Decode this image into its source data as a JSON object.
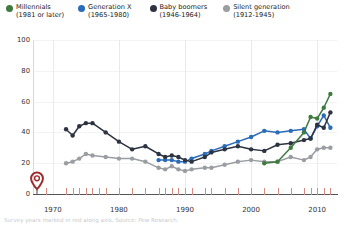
{
  "legend": {
    "position": "top",
    "items": [
      {
        "label": "Millennials",
        "sub": "(1981 or later)",
        "color": "#3f7a3f",
        "icon": "legend-dot-icon"
      },
      {
        "label": "Generation X",
        "sub": "(1965-1980)",
        "color": "#2b6cb8",
        "icon": "legend-dot-icon"
      },
      {
        "label": "Baby boomers",
        "sub": "(1946-1964)",
        "color": "#2d3340",
        "icon": "legend-dot-icon"
      },
      {
        "label": "Silent generation",
        "sub": "(1912-1945)",
        "color": "#9a9da1",
        "icon": "legend-dot-icon"
      }
    ]
  },
  "axes": {
    "y_ticks": [
      "0",
      "20",
      "40",
      "60",
      "80",
      "100"
    ],
    "x_ticks": [
      "1970",
      "1980",
      "1990",
      "2000",
      "2010"
    ]
  },
  "marker": {
    "name": "origin-pin-marker",
    "color": "#9e2b2b",
    "year": 1969,
    "value": 0
  },
  "caption": {
    "text": "Survey years marked in red along axis. Source: Pew Research."
  },
  "chart_data": {
    "type": "line",
    "title": "",
    "xlabel": "",
    "ylabel": "",
    "xlim": [
      1967,
      2013
    ],
    "ylim": [
      0,
      100
    ],
    "grid": "vertical-decades",
    "legend_position": "top",
    "survey_years": [
      1969,
      1972,
      1973,
      1974,
      1975,
      1976,
      1977,
      1978,
      1980,
      1982,
      1984,
      1986,
      1987,
      1988,
      1989,
      1990,
      1991,
      1993,
      1994,
      1996,
      1998,
      2000,
      2002,
      2004,
      2006,
      2008,
      2009,
      2010,
      2011,
      2012
    ],
    "series": [
      {
        "name": "Millennials",
        "color": "#3f7a3f",
        "points": [
          {
            "x": 2002,
            "y": 20
          },
          {
            "x": 2004,
            "y": 21
          },
          {
            "x": 2006,
            "y": 30
          },
          {
            "x": 2008,
            "y": 40
          },
          {
            "x": 2009,
            "y": 50
          },
          {
            "x": 2010,
            "y": 49
          },
          {
            "x": 2011,
            "y": 56
          },
          {
            "x": 2012,
            "y": 65
          }
        ]
      },
      {
        "name": "Generation X",
        "color": "#2b6cb8",
        "points": [
          {
            "x": 1986,
            "y": 22
          },
          {
            "x": 1987,
            "y": 22
          },
          {
            "x": 1988,
            "y": 22
          },
          {
            "x": 1989,
            "y": 21
          },
          {
            "x": 1990,
            "y": 21
          },
          {
            "x": 1991,
            "y": 23
          },
          {
            "x": 1993,
            "y": 26
          },
          {
            "x": 1994,
            "y": 28
          },
          {
            "x": 1996,
            "y": 31
          },
          {
            "x": 1998,
            "y": 34
          },
          {
            "x": 2000,
            "y": 37
          },
          {
            "x": 2002,
            "y": 41
          },
          {
            "x": 2004,
            "y": 40
          },
          {
            "x": 2006,
            "y": 41
          },
          {
            "x": 2008,
            "y": 42
          },
          {
            "x": 2009,
            "y": 36
          },
          {
            "x": 2010,
            "y": 44
          },
          {
            "x": 2011,
            "y": 51
          },
          {
            "x": 2012,
            "y": 43
          }
        ]
      },
      {
        "name": "Baby boomers",
        "color": "#2d3340",
        "points": [
          {
            "x": 1972,
            "y": 42
          },
          {
            "x": 1973,
            "y": 38
          },
          {
            "x": 1974,
            "y": 44
          },
          {
            "x": 1975,
            "y": 46
          },
          {
            "x": 1976,
            "y": 46
          },
          {
            "x": 1978,
            "y": 40
          },
          {
            "x": 1980,
            "y": 34
          },
          {
            "x": 1982,
            "y": 29
          },
          {
            "x": 1984,
            "y": 31
          },
          {
            "x": 1986,
            "y": 26
          },
          {
            "x": 1987,
            "y": 24
          },
          {
            "x": 1988,
            "y": 25
          },
          {
            "x": 1989,
            "y": 24
          },
          {
            "x": 1990,
            "y": 22
          },
          {
            "x": 1991,
            "y": 21
          },
          {
            "x": 1993,
            "y": 24
          },
          {
            "x": 1994,
            "y": 27
          },
          {
            "x": 1996,
            "y": 29
          },
          {
            "x": 1998,
            "y": 31
          },
          {
            "x": 2000,
            "y": 29
          },
          {
            "x": 2002,
            "y": 28
          },
          {
            "x": 2004,
            "y": 32
          },
          {
            "x": 2006,
            "y": 33
          },
          {
            "x": 2008,
            "y": 35
          },
          {
            "x": 2009,
            "y": 36
          },
          {
            "x": 2010,
            "y": 45
          },
          {
            "x": 2011,
            "y": 43
          },
          {
            "x": 2012,
            "y": 53
          }
        ]
      },
      {
        "name": "Silent generation",
        "color": "#9a9da1",
        "points": [
          {
            "x": 1972,
            "y": 20
          },
          {
            "x": 1973,
            "y": 21
          },
          {
            "x": 1974,
            "y": 23
          },
          {
            "x": 1975,
            "y": 26
          },
          {
            "x": 1976,
            "y": 25
          },
          {
            "x": 1978,
            "y": 24
          },
          {
            "x": 1980,
            "y": 23
          },
          {
            "x": 1982,
            "y": 23
          },
          {
            "x": 1984,
            "y": 21
          },
          {
            "x": 1986,
            "y": 17
          },
          {
            "x": 1987,
            "y": 16
          },
          {
            "x": 1988,
            "y": 18
          },
          {
            "x": 1989,
            "y": 16
          },
          {
            "x": 1990,
            "y": 15
          },
          {
            "x": 1991,
            "y": 16
          },
          {
            "x": 1993,
            "y": 17
          },
          {
            "x": 1994,
            "y": 17
          },
          {
            "x": 1996,
            "y": 19
          },
          {
            "x": 1998,
            "y": 21
          },
          {
            "x": 2000,
            "y": 22
          },
          {
            "x": 2002,
            "y": 21
          },
          {
            "x": 2004,
            "y": 21
          },
          {
            "x": 2006,
            "y": 24
          },
          {
            "x": 2008,
            "y": 22
          },
          {
            "x": 2009,
            "y": 24
          },
          {
            "x": 2010,
            "y": 29
          },
          {
            "x": 2011,
            "y": 30
          },
          {
            "x": 2012,
            "y": 30
          }
        ]
      }
    ]
  }
}
